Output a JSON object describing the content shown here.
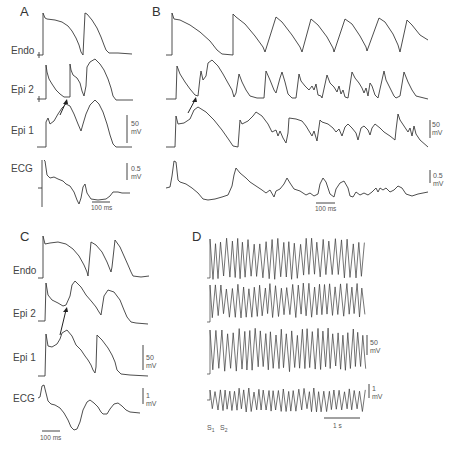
{
  "chart_data": [
    {
      "type": "line",
      "panel": "A",
      "title": "A",
      "series": [
        {
          "name": "Endo",
          "description": "2 action potentials"
        },
        {
          "name": "Epi 2",
          "description": "action potential with notch, early re-excitation (arrow)"
        },
        {
          "name": "Epi 1",
          "description": "two dome-shaped potentials"
        },
        {
          "name": "ECG",
          "description": "surface ECG"
        }
      ],
      "scale_bars": {
        "voltage": "50 mV",
        "ecg": "0.5 mV",
        "time": "100 ms"
      }
    },
    {
      "type": "line",
      "panel": "B",
      "title": "B",
      "series": [
        {
          "name": "Endo",
          "description": "7 repeated action potentials"
        },
        {
          "name": "Epi 2",
          "description": "irregular rapid activity"
        },
        {
          "name": "Epi 1",
          "description": "irregular rapid activity"
        },
        {
          "name": "ECG",
          "description": "polymorphic activity"
        }
      ],
      "scale_bars": {
        "voltage": "50 mV",
        "ecg": "0.5 mV",
        "time": "100 ms"
      }
    },
    {
      "type": "line",
      "panel": "C",
      "title": "C",
      "series": [
        {
          "name": "Endo",
          "description": "3 action potentials"
        },
        {
          "name": "Epi 2",
          "description": "2 potentials, arrow"
        },
        {
          "name": "Epi 1",
          "description": "2 potentials"
        },
        {
          "name": "ECG",
          "description": "surface ECG"
        }
      ],
      "scale_bars": {
        "voltage": "50 mV",
        "ecg": "1 mV",
        "time": "100 ms"
      }
    },
    {
      "type": "line",
      "panel": "D",
      "title": "D",
      "series": [
        {
          "name": "trace 1",
          "description": "sustained rapid oscillation"
        },
        {
          "name": "trace 2",
          "description": "sustained rapid oscillation"
        },
        {
          "name": "trace 3",
          "description": "sustained rapid oscillation"
        },
        {
          "name": "ECG",
          "description": "polymorphic ventricular tachycardia"
        }
      ],
      "annotations": [
        "S1",
        "S2"
      ],
      "scale_bars": {
        "voltage": "50 mV",
        "ecg": "1 mV",
        "time": "1 s"
      }
    }
  ],
  "panels": {
    "A": {
      "letter": "A",
      "labels": [
        "Endo",
        "Epi 2",
        "Epi 1",
        "ECG"
      ],
      "v_scale": [
        "50",
        "mV"
      ],
      "ecg_scale": [
        "0.5",
        "mV"
      ],
      "time_scale": "100 ms"
    },
    "B": {
      "letter": "B",
      "v_scale": [
        "50",
        "mV"
      ],
      "ecg_scale": [
        "0.5",
        "mV"
      ],
      "time_scale": "100 ms"
    },
    "C": {
      "letter": "C",
      "labels": [
        "Endo",
        "Epi 2",
        "Epi 1",
        "ECG"
      ],
      "v_scale": [
        "50",
        "mV"
      ],
      "ecg_scale": [
        "1",
        "mV"
      ],
      "time_scale": "100 ms"
    },
    "D": {
      "letter": "D",
      "v_scale": [
        "50",
        "mV"
      ],
      "ecg_scale": [
        "1",
        "mV"
      ],
      "time_scale": "1 s",
      "s1": "S",
      "s1_sub": "1",
      "s2": "S",
      "s2_sub": "2"
    }
  }
}
